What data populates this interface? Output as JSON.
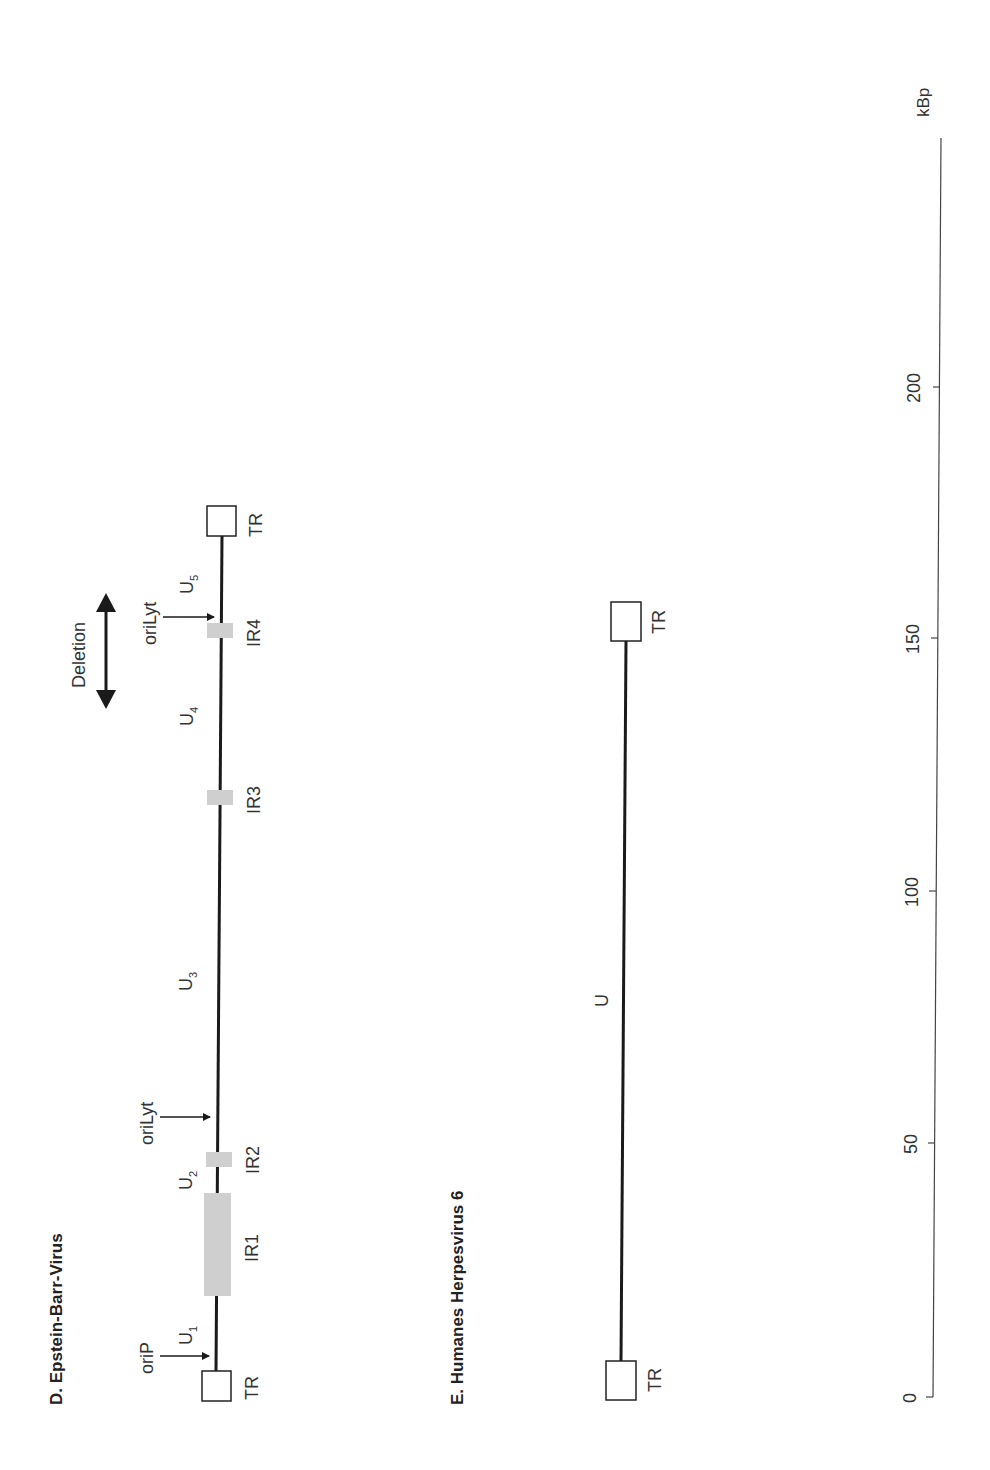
{
  "panels": {
    "ebv": {
      "title": "D. Epstein-Barr-Virus",
      "labels": {
        "tr_left": "TR",
        "tr_right": "TR",
        "u1": "U",
        "u1_sub": "1",
        "u2": "U",
        "u2_sub": "2",
        "u3": "U",
        "u3_sub": "3",
        "u4": "U",
        "u4_sub": "4",
        "u5": "U",
        "u5_sub": "5",
        "ir1": "IR1",
        "ir2": "IR2",
        "ir3": "IR3",
        "ir4": "IR4",
        "oriP": "oriP",
        "oriLyt_1": "oriLyt",
        "oriLyt_2": "oriLyt",
        "deletion": "Deletion"
      }
    },
    "hhv6": {
      "title": "E. Humanes Herpesvirus 6",
      "labels": {
        "tr_left": "TR",
        "tr_right": "TR",
        "u": "U"
      }
    }
  },
  "scale": {
    "unit": "kBp",
    "ticks": [
      "0",
      "50",
      "100",
      "150",
      "200"
    ]
  },
  "colors": {
    "line": "#1a1a1a",
    "repeat_fill": "#cfcfcf",
    "text": "#333333"
  }
}
